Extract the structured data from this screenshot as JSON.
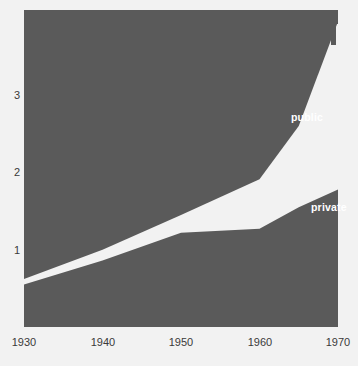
{
  "chart": {
    "type": "area",
    "title": "",
    "xlabel": "",
    "ylabel": "",
    "fill_color": "#5a5a5a",
    "band_color": "#f5f5f5",
    "background_color": "#f2f2f2",
    "plot_box": {
      "left": 24,
      "top": 10,
      "right": 338,
      "bottom": 327
    },
    "y_axis": {
      "ticks": [
        "1",
        "2",
        "3"
      ],
      "tick_values": [
        1,
        2,
        3
      ],
      "tick_y_px": [
        242,
        163,
        88
      ],
      "range": [
        0,
        4.1
      ],
      "grid": false
    },
    "x_axis": {
      "ticks": [
        "1930",
        "1940",
        "1950",
        "1960",
        "1970"
      ],
      "tick_values": [
        1930,
        1940,
        1950,
        1960,
        1970
      ],
      "tick_x_px": [
        24,
        102,
        180,
        258,
        336
      ],
      "range": [
        1930,
        1970
      ],
      "grid": false
    },
    "legend": {
      "position": "inline-on-bands",
      "entries": [
        "public",
        "private"
      ]
    }
  },
  "chart_data": {
    "type": "area",
    "title": "",
    "xlabel": "",
    "ylabel": "",
    "x": [
      1930,
      1940,
      1950,
      1960,
      1965,
      1970
    ],
    "series": [
      {
        "name": "public",
        "values": [
          0.62,
          1.0,
          1.45,
          1.91,
          2.6,
          3.95
        ],
        "label": "public",
        "label_x": 1964,
        "label_y": 2.72
      },
      {
        "name": "private",
        "values": [
          0.55,
          0.86,
          1.22,
          1.27,
          1.55,
          1.78
        ],
        "label": "private",
        "label_x": 1966.5,
        "label_y": 1.55
      }
    ],
    "xlim": [
      1930,
      1970
    ],
    "ylim": [
      0,
      4.1
    ],
    "grid": false,
    "legend_position": "inline"
  },
  "labels": {
    "public": "public",
    "private": "private"
  }
}
